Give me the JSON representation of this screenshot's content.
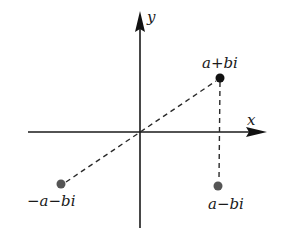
{
  "diagram": {
    "title": "",
    "axes": {
      "x_label": "x",
      "y_label": "y"
    },
    "points": [
      {
        "id": "z",
        "label": "a+bi",
        "color": "#111111"
      },
      {
        "id": "conjugate",
        "label": "a−bi",
        "color": "#555555"
      },
      {
        "id": "negative",
        "label": "−a−bi",
        "color": "#555555"
      }
    ],
    "connectors": [
      {
        "from": "negative",
        "to": "z",
        "style": "dashed",
        "through": "origin"
      },
      {
        "from": "z",
        "to": "conjugate",
        "style": "dashed"
      }
    ]
  }
}
